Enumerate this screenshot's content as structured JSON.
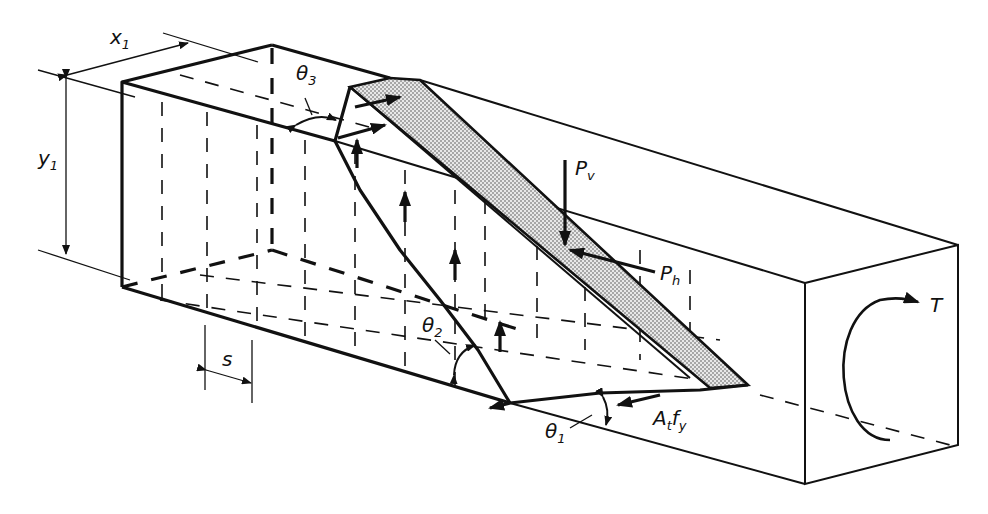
{
  "figure": {
    "labels": {
      "x1": {
        "main": "x",
        "sub": "1"
      },
      "y1": {
        "main": "y",
        "sub": "1"
      },
      "theta1": {
        "main": "θ",
        "sub": "1"
      },
      "theta2": {
        "main": "θ",
        "sub": "2"
      },
      "theta3": {
        "main": "θ",
        "sub": "3"
      },
      "pv": {
        "main": "P",
        "sub": "v"
      },
      "ph": {
        "main": "P",
        "sub": "h"
      },
      "atfy": {
        "main": "A",
        "sub": "t",
        "main2": "f",
        "sub2": "y"
      },
      "s": {
        "main": "s"
      },
      "t": {
        "main": "T"
      }
    },
    "colors": {
      "ink": "#111111",
      "background": "#ffffff",
      "hatch": "#bdbdbd"
    }
  }
}
